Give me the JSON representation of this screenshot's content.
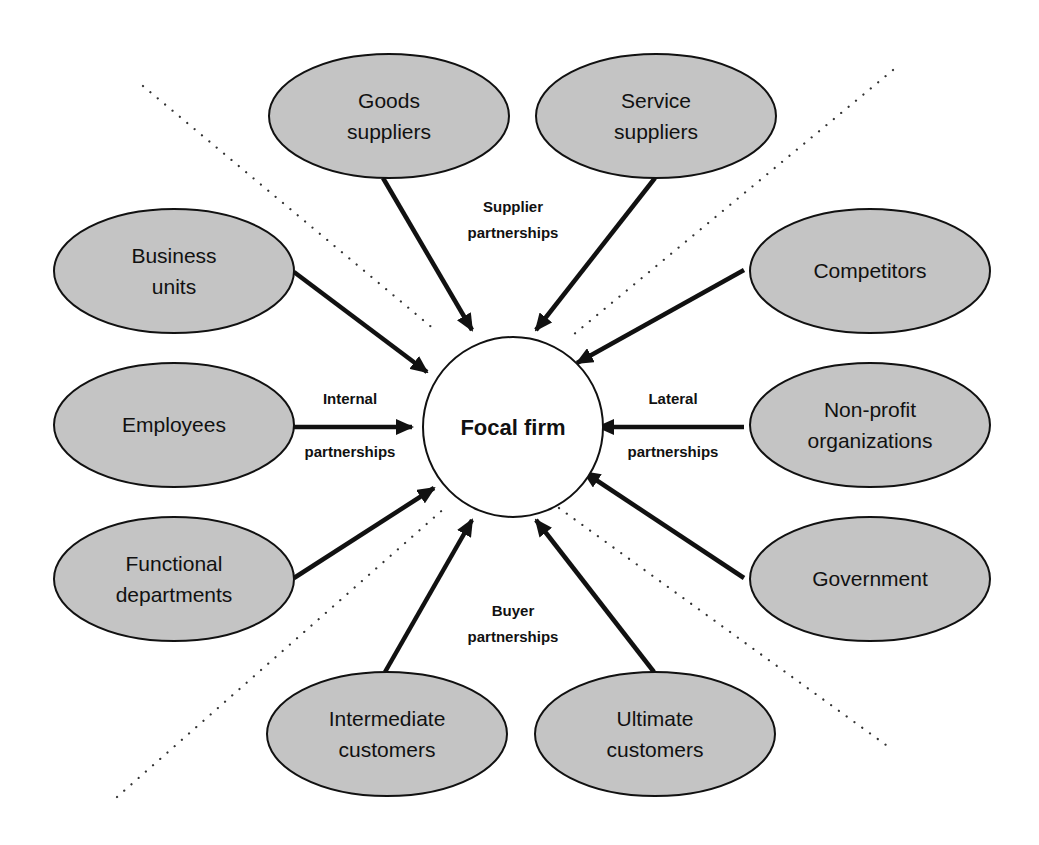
{
  "diagram": {
    "center": {
      "label": "Focal firm",
      "cx": 513,
      "cy": 427,
      "r": 90
    },
    "colors": {
      "node_fill": "#c4c4c4",
      "stroke": "#111111",
      "background": "#ffffff",
      "dots": "#333333"
    },
    "groups": [
      {
        "id": "supplier",
        "lines": [
          "Supplier",
          "partnerships"
        ],
        "x": 513,
        "y": 212
      },
      {
        "id": "internal",
        "lines": [
          "Internal",
          "partnerships"
        ],
        "x": 350,
        "y": 404,
        "y2": 457
      },
      {
        "id": "lateral",
        "lines": [
          "Lateral",
          "partnerships"
        ],
        "x": 673,
        "y": 404,
        "y2": 457
      },
      {
        "id": "buyer",
        "lines": [
          "Buyer",
          "partnerships"
        ],
        "x": 513,
        "y": 616
      }
    ],
    "nodes": [
      {
        "id": "goods-suppliers",
        "lines": [
          "Goods",
          "suppliers"
        ],
        "cx": 389,
        "cy": 116,
        "group": "supplier"
      },
      {
        "id": "service-suppliers",
        "lines": [
          "Service",
          "suppliers"
        ],
        "cx": 656,
        "cy": 116,
        "group": "supplier"
      },
      {
        "id": "business-units",
        "lines": [
          "Business",
          "units"
        ],
        "cx": 174,
        "cy": 271,
        "group": "internal"
      },
      {
        "id": "employees",
        "lines": [
          "Employees"
        ],
        "cx": 174,
        "cy": 425,
        "group": "internal"
      },
      {
        "id": "functional-departments",
        "lines": [
          "Functional",
          "departments"
        ],
        "cx": 174,
        "cy": 579,
        "group": "internal"
      },
      {
        "id": "intermediate-customers",
        "lines": [
          "Intermediate",
          "customers"
        ],
        "cx": 387,
        "cy": 734,
        "group": "buyer"
      },
      {
        "id": "ultimate-customers",
        "lines": [
          "Ultimate",
          "customers"
        ],
        "cx": 655,
        "cy": 734,
        "group": "buyer"
      },
      {
        "id": "competitors",
        "lines": [
          "Competitors"
        ],
        "cx": 870,
        "cy": 271,
        "group": "lateral"
      },
      {
        "id": "non-profit-organizations",
        "lines": [
          "Non-profit",
          "organizations"
        ],
        "cx": 870,
        "cy": 425,
        "group": "lateral"
      },
      {
        "id": "government",
        "lines": [
          "Government"
        ],
        "cx": 870,
        "cy": 579,
        "group": "lateral"
      }
    ],
    "arrows": [
      {
        "from": "goods-suppliers",
        "x1": 383,
        "y1": 178,
        "x2": 472,
        "y2": 330
      },
      {
        "from": "service-suppliers",
        "x1": 655,
        "y1": 178,
        "x2": 536,
        "y2": 330
      },
      {
        "from": "business-units",
        "x1": 294,
        "y1": 272,
        "x2": 427,
        "y2": 372
      },
      {
        "from": "employees",
        "x1": 294,
        "y1": 427,
        "x2": 412,
        "y2": 427
      },
      {
        "from": "functional-departments",
        "x1": 294,
        "y1": 578,
        "x2": 434,
        "y2": 488
      },
      {
        "from": "intermediate-customers",
        "x1": 385,
        "y1": 672,
        "x2": 472,
        "y2": 520
      },
      {
        "from": "ultimate-customers",
        "x1": 654,
        "y1": 672,
        "x2": 536,
        "y2": 520
      },
      {
        "from": "competitors",
        "x1": 744,
        "y1": 270,
        "x2": 577,
        "y2": 363
      },
      {
        "from": "non-profit-organizations",
        "x1": 744,
        "y1": 427,
        "x2": 598,
        "y2": 427
      },
      {
        "from": "government",
        "x1": 744,
        "y1": 578,
        "x2": 584,
        "y2": 472
      }
    ],
    "dividers": [
      {
        "x1": 143,
        "y1": 86,
        "x2": 435,
        "y2": 330
      },
      {
        "x1": 893,
        "y1": 70,
        "x2": 573,
        "y2": 335
      },
      {
        "x1": 117,
        "y1": 797,
        "x2": 447,
        "y2": 506
      },
      {
        "x1": 559,
        "y1": 508,
        "x2": 893,
        "y2": 750
      }
    ],
    "ellipse_rx": 120,
    "ellipse_ry": 62
  }
}
